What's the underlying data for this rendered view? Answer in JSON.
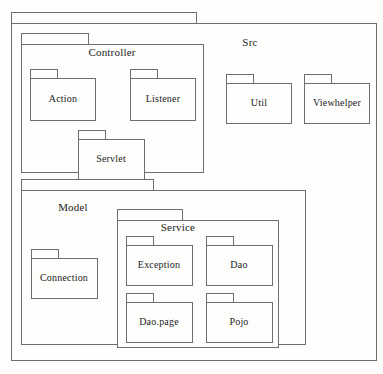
{
  "diagram": {
    "type": "uml-package-diagram",
    "width": 383,
    "height": 374,
    "background_color": "#fdfdfb",
    "line_color": "#6e6e6e",
    "text_color": "#1b1b1b"
  },
  "packages": {
    "src": {
      "label": "Src",
      "children": [
        "controller",
        "util",
        "viewhelper",
        "model"
      ]
    },
    "controller": {
      "label": "Controller",
      "children": [
        "action",
        "listener",
        "servlet"
      ]
    },
    "action": {
      "label": "Action",
      "children": []
    },
    "listener": {
      "label": "Listener",
      "children": []
    },
    "servlet": {
      "label": "Servlet",
      "children": []
    },
    "util": {
      "label": "Util",
      "children": []
    },
    "viewhelper": {
      "label": "Viewhelper",
      "children": []
    },
    "model": {
      "label": "Model",
      "children": [
        "connection",
        "service"
      ]
    },
    "connection": {
      "label": "Connection",
      "children": []
    },
    "service": {
      "label": "Service",
      "children": [
        "exception",
        "dao",
        "daopage",
        "pojo"
      ]
    },
    "exception": {
      "label": "Exception",
      "children": []
    },
    "dao": {
      "label": "Dao",
      "children": []
    },
    "daopage": {
      "label": "Dao.page",
      "children": []
    },
    "pojo": {
      "label": "Pojo",
      "children": []
    }
  }
}
